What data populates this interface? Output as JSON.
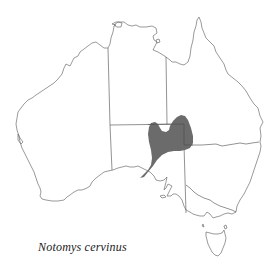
{
  "caption": {
    "species_name": "Notomys cervinus"
  },
  "map": {
    "region": "Australia",
    "distribution_color": "#6b6b6b",
    "coast_color": "#6e6e6e",
    "border_color": "#4a4a4a"
  }
}
